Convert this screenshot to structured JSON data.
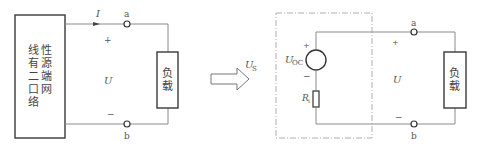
{
  "left_circuit": {
    "network_label_lines": [
      "线性",
      "有源",
      "二端",
      "口网",
      "络"
    ],
    "network_label_col_left": [
      "线",
      "有",
      "二",
      "口",
      "络"
    ],
    "network_label_col_right": [
      "性",
      "源",
      "端",
      "网"
    ],
    "current_label": "I",
    "terminal_top": "a",
    "terminal_bottom": "b",
    "plus": "+",
    "minus": "−",
    "voltage_label": "U",
    "load_label_lines": [
      "负",
      "载"
    ]
  },
  "transform_arrow": {
    "label_main": "U",
    "label_sub": "S"
  },
  "right_circuit": {
    "source_label_main": "U",
    "source_label_sub": "OC",
    "source_plus": "+",
    "source_minus": "−",
    "resistor_label_main": "R",
    "resistor_label_sub": "i",
    "terminal_top": "a",
    "terminal_bottom": "b",
    "plus": "+",
    "minus": "−",
    "voltage_label": "U",
    "load_label_lines": [
      "负",
      "载"
    ]
  },
  "colors": {
    "wire": "#8a8a8a",
    "box_stroke": "#3a3a3a",
    "dashed_boundary": "#b0b0b0",
    "text": "#555555"
  }
}
